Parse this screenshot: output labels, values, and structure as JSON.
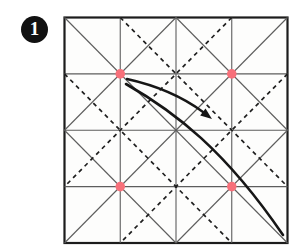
{
  "step": {
    "number": "1"
  },
  "colors": {
    "background": "#ffffff",
    "paper_fill": "#fdfdfc",
    "border": "#1c1c1c",
    "crease_solid": "#5d5d5d",
    "crease_dashed": "#1f1f1f",
    "dot": "#f7707a",
    "arrow": "#161616",
    "badge_bg": "#111111",
    "badge_text": "#ffffff"
  },
  "paper": {
    "x": 64.5,
    "y": 17.5,
    "width": 223,
    "height": 225.5
  },
  "creases": {
    "solid": [
      {
        "x1": 120.25,
        "y1": 17.5,
        "x2": 120.25,
        "y2": 243
      },
      {
        "x1": 176,
        "y1": 17.5,
        "x2": 176,
        "y2": 243
      },
      {
        "x1": 231.75,
        "y1": 17.5,
        "x2": 231.75,
        "y2": 243
      },
      {
        "x1": 64.5,
        "y1": 73.9,
        "x2": 287.5,
        "y2": 73.9
      },
      {
        "x1": 64.5,
        "y1": 130.25,
        "x2": 287.5,
        "y2": 130.25
      },
      {
        "x1": 64.5,
        "y1": 186.6,
        "x2": 287.5,
        "y2": 186.6
      },
      {
        "x1": 64.5,
        "y1": 17.5,
        "x2": 287.5,
        "y2": 243
      },
      {
        "x1": 287.5,
        "y1": 17.5,
        "x2": 64.5,
        "y2": 243
      },
      {
        "x1": 176,
        "y1": 17.5,
        "x2": 287.5,
        "y2": 130.25
      },
      {
        "x1": 287.5,
        "y1": 130.25,
        "x2": 176,
        "y2": 243
      },
      {
        "x1": 176,
        "y1": 243,
        "x2": 64.5,
        "y2": 130.25
      },
      {
        "x1": 64.5,
        "y1": 130.25,
        "x2": 176,
        "y2": 17.5
      }
    ],
    "dashed": [
      {
        "x1": 120.25,
        "y1": 17.5,
        "x2": 287.5,
        "y2": 186.6
      },
      {
        "x1": 231.75,
        "y1": 17.5,
        "x2": 64.5,
        "y2": 186.6
      },
      {
        "x1": 64.5,
        "y1": 73.9,
        "x2": 231.75,
        "y2": 243
      },
      {
        "x1": 287.5,
        "y1": 73.9,
        "x2": 120.25,
        "y2": 243
      }
    ]
  },
  "dots": [
    {
      "cx": 120.25,
      "cy": 73.9
    },
    {
      "cx": 231.75,
      "cy": 73.9
    },
    {
      "cx": 120.25,
      "cy": 186.6
    },
    {
      "cx": 231.75,
      "cy": 186.6
    }
  ],
  "arrows": {
    "fold_arrow": {
      "shaft_path": "M 127 79 Q 172 89 203 112",
      "head": {
        "x": 212,
        "y": 119,
        "angle": 37,
        "length": 11.5,
        "half_width": 4.4
      }
    },
    "sweep_arrow": {
      "shaft_path": "M 126 84 C 175 112 225 150 283 235"
    }
  }
}
